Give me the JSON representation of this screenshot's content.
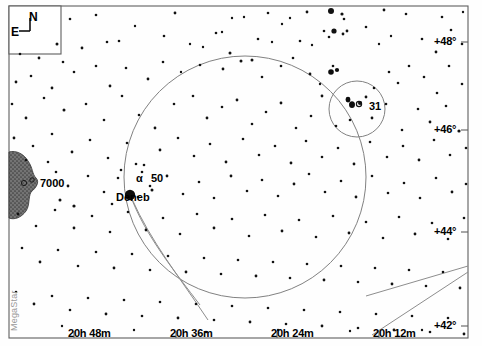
{
  "chart_data": {
    "type": "scatter",
    "xlabel": "Right Ascension",
    "ylabel": "Declination",
    "grid": false,
    "legend_position": "none",
    "projection": "equatorial",
    "xlim": [
      "20h 54m",
      "20h 06m"
    ],
    "ylim": [
      41.0,
      49.0
    ],
    "x_ticks": [
      {
        "label": "20h 48m",
        "px": 74
      },
      {
        "label": "20h 36m",
        "px": 176
      },
      {
        "label": "20h 24m",
        "px": 277
      },
      {
        "label": "20h 12m",
        "px": 379
      }
    ],
    "y_ticks": [
      {
        "label": "+48°",
        "px": 42
      },
      {
        "label": "+46°",
        "px": 130
      },
      {
        "label": "+44°",
        "px": 232
      },
      {
        "label": "+42°",
        "px": 326
      }
    ],
    "labeled_objects": [
      {
        "name": "Deneb",
        "label": "Deneb",
        "x": 130,
        "y": 195,
        "mag": 1.25,
        "marker_r": 5.2
      },
      {
        "name": "alpha-cygni-bayer",
        "label": "α",
        "x": 146,
        "y": 180
      },
      {
        "name": "flamsteed-50",
        "label": "50",
        "x": 160,
        "y": 180
      },
      {
        "name": "ngc-7000",
        "label": "7000",
        "x": 40,
        "y": 184
      },
      {
        "name": "ngc-6871-cluster",
        "label": "31",
        "x": 372,
        "y": 107
      }
    ],
    "circles": [
      {
        "name": "main-field-circle",
        "cx": 245,
        "cy": 177,
        "r": 121
      },
      {
        "name": "cluster-circle",
        "cx": 357,
        "cy": 109,
        "r": 28
      }
    ],
    "nebula": {
      "name": "North America Nebula",
      "catalog": "NGC 7000",
      "fill": "#6b6b6b"
    },
    "stars": [
      [
        70,
        19,
        1.3
      ],
      [
        96,
        15,
        1.3
      ],
      [
        135,
        26,
        1.2
      ],
      [
        175,
        13,
        1.4
      ],
      [
        232,
        18,
        1.2
      ],
      [
        244,
        17,
        1.2
      ],
      [
        222,
        32,
        1.2
      ],
      [
        268,
        13,
        1.3
      ],
      [
        282,
        24,
        1.2
      ],
      [
        290,
        18,
        1.2
      ],
      [
        307,
        12,
        1.4
      ],
      [
        331,
        11,
        3.0
      ],
      [
        342,
        14,
        1.6
      ],
      [
        344,
        19,
        1.3
      ],
      [
        384,
        10,
        1.4
      ],
      [
        406,
        14,
        1.3
      ],
      [
        442,
        17,
        1.3
      ],
      [
        463,
        12,
        1.2
      ],
      [
        20,
        54,
        1.3
      ],
      [
        39,
        58,
        1.4
      ],
      [
        57,
        44,
        1.5
      ],
      [
        63,
        62,
        1.3
      ],
      [
        82,
        48,
        1.4
      ],
      [
        107,
        42,
        1.3
      ],
      [
        119,
        41,
        1.3
      ],
      [
        164,
        36,
        1.3
      ],
      [
        190,
        44,
        1.2
      ],
      [
        203,
        47,
        1.2
      ],
      [
        216,
        33,
        1.3
      ],
      [
        230,
        53,
        1.5
      ],
      [
        258,
        39,
        1.3
      ],
      [
        272,
        42,
        1.2
      ],
      [
        300,
        41,
        1.3
      ],
      [
        312,
        45,
        1.2
      ],
      [
        324,
        31,
        1.3
      ],
      [
        329,
        37,
        1.3
      ],
      [
        334,
        31,
        2.6
      ],
      [
        343,
        34,
        1.4
      ],
      [
        347,
        31,
        1.4
      ],
      [
        366,
        27,
        1.3
      ],
      [
        379,
        44,
        1.2
      ],
      [
        391,
        36,
        1.2
      ],
      [
        422,
        39,
        1.3
      ],
      [
        436,
        52,
        1.4
      ],
      [
        451,
        30,
        1.3
      ],
      [
        462,
        44,
        1.3
      ],
      [
        16,
        82,
        1.4
      ],
      [
        31,
        76,
        1.3
      ],
      [
        52,
        88,
        1.4
      ],
      [
        74,
        72,
        1.3
      ],
      [
        96,
        66,
        1.3
      ],
      [
        110,
        86,
        1.4
      ],
      [
        126,
        68,
        1.3
      ],
      [
        148,
        79,
        1.4
      ],
      [
        163,
        62,
        1.3
      ],
      [
        181,
        72,
        1.2
      ],
      [
        200,
        65,
        1.3
      ],
      [
        223,
        69,
        1.4
      ],
      [
        241,
        61,
        1.5
      ],
      [
        252,
        60,
        1.5
      ],
      [
        262,
        77,
        1.3
      ],
      [
        281,
        66,
        1.3
      ],
      [
        293,
        58,
        1.3
      ],
      [
        310,
        74,
        1.4
      ],
      [
        320,
        84,
        1.2
      ],
      [
        333,
        66,
        1.3
      ],
      [
        348,
        99,
        2.3
      ],
      [
        352,
        104,
        2.7
      ],
      [
        360,
        103,
        2.0
      ],
      [
        366,
        97,
        1.4
      ],
      [
        374,
        88,
        1.3
      ],
      [
        389,
        72,
        1.3
      ],
      [
        398,
        83,
        1.3
      ],
      [
        409,
        66,
        1.3
      ],
      [
        424,
        77,
        1.3
      ],
      [
        437,
        93,
        1.3
      ],
      [
        449,
        66,
        1.3
      ],
      [
        462,
        84,
        1.3
      ],
      [
        12,
        104,
        1.3
      ],
      [
        26,
        118,
        1.4
      ],
      [
        44,
        98,
        1.3
      ],
      [
        64,
        110,
        1.5
      ],
      [
        86,
        104,
        1.3
      ],
      [
        104,
        120,
        1.3
      ],
      [
        122,
        96,
        1.3
      ],
      [
        139,
        115,
        1.3
      ],
      [
        155,
        128,
        1.4
      ],
      [
        174,
        104,
        1.3
      ],
      [
        193,
        96,
        1.3
      ],
      [
        207,
        118,
        1.4
      ],
      [
        222,
        107,
        1.3
      ],
      [
        237,
        100,
        1.4
      ],
      [
        252,
        124,
        1.3
      ],
      [
        266,
        112,
        1.3
      ],
      [
        281,
        103,
        1.4
      ],
      [
        296,
        128,
        1.3
      ],
      [
        311,
        116,
        1.3
      ],
      [
        322,
        96,
        1.4
      ],
      [
        336,
        126,
        1.3
      ],
      [
        350,
        120,
        1.3
      ],
      [
        372,
        118,
        1.4
      ],
      [
        386,
        104,
        1.3
      ],
      [
        402,
        130,
        1.3
      ],
      [
        418,
        109,
        1.3
      ],
      [
        430,
        122,
        1.4
      ],
      [
        446,
        106,
        1.3
      ],
      [
        459,
        131,
        1.6
      ],
      [
        14,
        138,
        1.4
      ],
      [
        33,
        146,
        1.3
      ],
      [
        52,
        134,
        1.3
      ],
      [
        72,
        152,
        1.4
      ],
      [
        90,
        140,
        1.3
      ],
      [
        108,
        158,
        1.3
      ],
      [
        127,
        143,
        1.3
      ],
      [
        144,
        165,
        1.3
      ],
      [
        160,
        150,
        1.4
      ],
      [
        178,
        138,
        1.3
      ],
      [
        194,
        156,
        1.3
      ],
      [
        210,
        144,
        1.3
      ],
      [
        226,
        162,
        1.4
      ],
      [
        243,
        139,
        1.3
      ],
      [
        259,
        155,
        1.3
      ],
      [
        275,
        146,
        1.3
      ],
      [
        291,
        163,
        1.4
      ],
      [
        306,
        141,
        1.3
      ],
      [
        322,
        157,
        1.3
      ],
      [
        338,
        148,
        1.3
      ],
      [
        354,
        164,
        1.4
      ],
      [
        370,
        142,
        1.3
      ],
      [
        387,
        157,
        1.3
      ],
      [
        403,
        146,
        1.3
      ],
      [
        419,
        160,
        1.4
      ],
      [
        434,
        140,
        1.3
      ],
      [
        450,
        155,
        1.3
      ],
      [
        466,
        148,
        1.3
      ],
      [
        56,
        172,
        1.3
      ],
      [
        68,
        186,
        1.4
      ],
      [
        88,
        176,
        1.3
      ],
      [
        104,
        192,
        1.3
      ],
      [
        121,
        170,
        1.3
      ],
      [
        138,
        197,
        1.3
      ],
      [
        150,
        186,
        1.3
      ],
      [
        167,
        176,
        1.4
      ],
      [
        183,
        194,
        1.3
      ],
      [
        199,
        182,
        1.3
      ],
      [
        214,
        198,
        1.3
      ],
      [
        231,
        176,
        1.4
      ],
      [
        247,
        191,
        1.3
      ],
      [
        262,
        180,
        1.3
      ],
      [
        278,
        196,
        1.3
      ],
      [
        294,
        184,
        1.4
      ],
      [
        309,
        174,
        1.3
      ],
      [
        325,
        192,
        1.3
      ],
      [
        341,
        181,
        1.3
      ],
      [
        356,
        197,
        1.4
      ],
      [
        372,
        176,
        1.3
      ],
      [
        388,
        193,
        1.3
      ],
      [
        404,
        183,
        1.3
      ],
      [
        420,
        198,
        1.3
      ],
      [
        436,
        178,
        1.3
      ],
      [
        452,
        192,
        1.4
      ],
      [
        466,
        184,
        1.3
      ],
      [
        18,
        214,
        1.4
      ],
      [
        36,
        226,
        1.3
      ],
      [
        55,
        210,
        1.3
      ],
      [
        74,
        228,
        1.4
      ],
      [
        92,
        216,
        1.3
      ],
      [
        110,
        232,
        1.3
      ],
      [
        128,
        212,
        1.3
      ],
      [
        146,
        230,
        1.4
      ],
      [
        163,
        218,
        1.3
      ],
      [
        180,
        234,
        1.3
      ],
      [
        197,
        214,
        1.3
      ],
      [
        214,
        228,
        1.4
      ],
      [
        232,
        219,
        1.3
      ],
      [
        249,
        236,
        1.3
      ],
      [
        265,
        215,
        1.3
      ],
      [
        282,
        231,
        1.4
      ],
      [
        299,
        220,
        1.3
      ],
      [
        316,
        237,
        1.3
      ],
      [
        333,
        216,
        1.3
      ],
      [
        349,
        233,
        1.4
      ],
      [
        366,
        222,
        1.3
      ],
      [
        383,
        238,
        1.3
      ],
      [
        399,
        217,
        1.3
      ],
      [
        415,
        234,
        1.4
      ],
      [
        432,
        223,
        1.3
      ],
      [
        448,
        239,
        1.3
      ],
      [
        464,
        218,
        1.3
      ],
      [
        22,
        248,
        1.3
      ],
      [
        40,
        262,
        1.4
      ],
      [
        58,
        250,
        1.3
      ],
      [
        78,
        266,
        1.3
      ],
      [
        96,
        252,
        1.3
      ],
      [
        114,
        268,
        1.4
      ],
      [
        132,
        254,
        1.3
      ],
      [
        150,
        270,
        1.3
      ],
      [
        168,
        256,
        1.3
      ],
      [
        186,
        272,
        1.4
      ],
      [
        204,
        258,
        1.3
      ],
      [
        221,
        274,
        1.3
      ],
      [
        238,
        260,
        1.3
      ],
      [
        256,
        276,
        1.4
      ],
      [
        273,
        262,
        1.3
      ],
      [
        290,
        278,
        1.3
      ],
      [
        307,
        264,
        1.3
      ],
      [
        324,
        280,
        1.4
      ],
      [
        341,
        266,
        1.3
      ],
      [
        358,
        282,
        1.3
      ],
      [
        375,
        268,
        1.3
      ],
      [
        392,
        284,
        1.4
      ],
      [
        409,
        270,
        1.3
      ],
      [
        426,
        286,
        1.3
      ],
      [
        443,
        272,
        1.3
      ],
      [
        460,
        288,
        1.4
      ],
      [
        16,
        292,
        1.3
      ],
      [
        34,
        304,
        1.4
      ],
      [
        52,
        296,
        1.3
      ],
      [
        70,
        310,
        1.3
      ],
      [
        88,
        298,
        1.3
      ],
      [
        106,
        314,
        1.4
      ],
      [
        124,
        300,
        1.3
      ],
      [
        142,
        316,
        1.3
      ],
      [
        160,
        302,
        1.3
      ],
      [
        178,
        318,
        1.4
      ],
      [
        196,
        304,
        1.3
      ],
      [
        214,
        320,
        1.3
      ],
      [
        232,
        306,
        1.3
      ],
      [
        250,
        322,
        1.4
      ],
      [
        268,
        308,
        1.3
      ],
      [
        286,
        324,
        1.3
      ],
      [
        304,
        310,
        1.3
      ],
      [
        322,
        326,
        1.4
      ],
      [
        340,
        312,
        1.3
      ],
      [
        358,
        328,
        1.3
      ],
      [
        376,
        314,
        1.3
      ],
      [
        394,
        330,
        1.4
      ],
      [
        412,
        316,
        1.3
      ],
      [
        430,
        332,
        1.3
      ],
      [
        448,
        318,
        1.3
      ],
      [
        464,
        334,
        1.4
      ],
      [
        30,
        338,
        1.2
      ],
      [
        62,
        326,
        1.2
      ],
      [
        98,
        338,
        1.2
      ],
      [
        134,
        330,
        1.2
      ],
      [
        170,
        340,
        1.2
      ],
      [
        206,
        332,
        1.2
      ],
      [
        242,
        340,
        1.2
      ],
      [
        278,
        330,
        1.2
      ],
      [
        314,
        340,
        1.2
      ],
      [
        350,
        331,
        1.2
      ],
      [
        386,
        341,
        1.2
      ],
      [
        422,
        330,
        1.2
      ],
      [
        458,
        341,
        1.2
      ],
      [
        152,
        190,
        1.5
      ],
      [
        142,
        172,
        1.3
      ],
      [
        136,
        164,
        1.3
      ],
      [
        118,
        178,
        1.3
      ],
      [
        112,
        204,
        1.3
      ],
      [
        8,
        166,
        1.2
      ],
      [
        26,
        160,
        1.3
      ],
      [
        48,
        162,
        1.3
      ],
      [
        60,
        200,
        1.5
      ],
      [
        74,
        206,
        1.6
      ]
    ]
  },
  "frame": {
    "name": "chart-border",
    "left": 9,
    "top": 6,
    "right": 468,
    "bottom": 338,
    "stroke": "#555555"
  },
  "compass": {
    "box": {
      "left": 9,
      "top": 6,
      "width": 52,
      "height": 48
    },
    "north_label": "N",
    "east_label": "E"
  },
  "watermark": {
    "text": "MegaStar"
  },
  "colors": {
    "star": "#111111",
    "line": "#8a8a8a",
    "circle": "#777777",
    "border": "#606060",
    "nebula": "#6e6e6e",
    "text": "#000000"
  }
}
